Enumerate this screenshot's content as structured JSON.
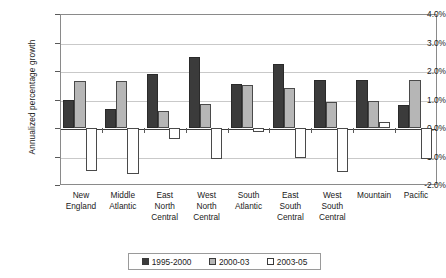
{
  "chart_data": {
    "type": "bar",
    "title": "",
    "xlabel": "",
    "ylabel": "Annualized percentage growth",
    "ylim": [
      -2.0,
      4.0
    ],
    "ytick_labels": [
      "4.0%",
      "3.0%",
      "2.0%",
      "1.0%",
      "0.0%",
      "-1.0%",
      "-2.0%"
    ],
    "ytick_values": [
      4.0,
      3.0,
      2.0,
      1.0,
      0.0,
      -1.0,
      -2.0
    ],
    "grid": true,
    "legend_position": "bottom",
    "value_unit": "percent",
    "categories": [
      "New England",
      "Middle Atlantic",
      "East North Central",
      "West North Central",
      "South Atlantic",
      "East South Central",
      "West South Central",
      "Mountain",
      "Pacific"
    ],
    "category_lines": [
      [
        "New",
        "England"
      ],
      [
        "Middle",
        "Atlantic"
      ],
      [
        "East",
        "North",
        "Central"
      ],
      [
        "West",
        "North",
        "Central"
      ],
      [
        "South",
        "Atlantic"
      ],
      [
        "East",
        "South",
        "Central"
      ],
      [
        "West",
        "South",
        "Central"
      ],
      [
        "Mountain"
      ],
      [
        "Pacific"
      ]
    ],
    "series": [
      {
        "name": "1995-2000",
        "color": "#3b3b3b",
        "values": [
          1.0,
          0.65,
          1.9,
          2.5,
          1.55,
          2.25,
          1.7,
          1.7,
          0.8
        ]
      },
      {
        "name": "2000-03",
        "color": "#b6b6b6",
        "values": [
          1.65,
          1.65,
          0.6,
          0.85,
          1.5,
          1.4,
          0.9,
          0.95,
          1.7
        ]
      },
      {
        "name": "2003-05",
        "color": "#ffffff",
        "values": [
          -1.5,
          -1.6,
          -0.4,
          -1.1,
          -0.15,
          -1.05,
          -1.55,
          0.2,
          -1.1
        ]
      }
    ]
  },
  "legend": {
    "items": [
      {
        "label": "1995-2000",
        "color": "#3b3b3b"
      },
      {
        "label": "2000-03",
        "color": "#b6b6b6"
      },
      {
        "label": "2003-05",
        "color": "#ffffff"
      }
    ]
  }
}
